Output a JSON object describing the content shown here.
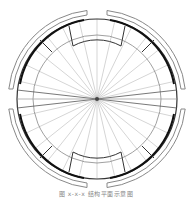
{
  "diagram": {
    "type": "circular-plan",
    "center": [
      97,
      99
    ],
    "rings": [
      {
        "name": "outer-shell",
        "r_outer": 89,
        "r_inner": 84,
        "color": "#888888"
      },
      {
        "name": "wall",
        "r": 80,
        "color": "#222222"
      },
      {
        "name": "mid-ring",
        "r": 64,
        "color": "#666666"
      },
      {
        "name": "inner-ring",
        "r": 50,
        "color": "#444444"
      }
    ],
    "radial_lines": 28,
    "openings": [
      "top",
      "bottom",
      "left",
      "right"
    ],
    "line_color": "#999999"
  },
  "caption": {
    "text": "图 x-x-x  结构平面示意图"
  }
}
